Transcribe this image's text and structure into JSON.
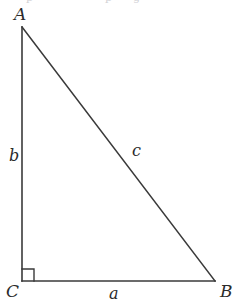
{
  "figure": {
    "kind": "right-triangle-diagram",
    "background_color": "#ffffff",
    "stroke_color": "#3a3a3a",
    "text_color": "#2b2b2b",
    "stroke_width": 1.6,
    "width": 238,
    "height": 305,
    "clipped_top_text": {
      "note": "faint descenders of a line of text cropped off above the figure",
      "fragments": [
        "p",
        "p",
        "g"
      ],
      "color": "#d2d2d6"
    },
    "vertices": {
      "A": {
        "label": "A",
        "x": 22,
        "y": 27,
        "label_x": 14,
        "label_y": 6
      },
      "B": {
        "label": "B",
        "x": 215,
        "y": 281,
        "label_x": 220,
        "label_y": 283
      },
      "C": {
        "label": "C",
        "x": 22,
        "y": 281,
        "label_x": 6,
        "label_y": 283
      }
    },
    "sides": {
      "a": {
        "label": "a",
        "from": "C",
        "to": "B",
        "label_x": 109,
        "label_y": 286
      },
      "b": {
        "label": "b",
        "from": "C",
        "to": "A",
        "label_x": 9,
        "label_y": 148
      },
      "c": {
        "label": "c",
        "from": "A",
        "to": "B",
        "label_x": 132,
        "label_y": 143
      }
    },
    "right_angle": {
      "at_vertex": "C",
      "marker": "square",
      "size": 12,
      "x": 22,
      "y": 269
    }
  }
}
